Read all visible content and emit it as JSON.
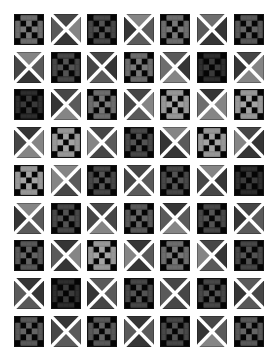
{
  "pattern": {
    "columns": 7,
    "rows": 9,
    "tile_size": [
      30,
      31
    ],
    "pitch": [
      36.6,
      37.7
    ],
    "shades": {
      "vdark": "#1c1c1c",
      "dark": "#353535",
      "mdark": "#464646",
      "mid": "#5a5a5a",
      "mlight": "#6e6e6e",
      "light": "#858585",
      "black": "#050505",
      "seam": "#ffffff"
    },
    "tiles": [
      [
        "C:mid",
        "X:mdark,light,dark,mid",
        "C:dark",
        "X:light,mid,mid,dark",
        "C:mid",
        "X:mlight,dark,dark,mid",
        "C:mdark"
      ],
      [
        "X:light,mid,dark,mdark",
        "C:dark",
        "X:mdark,dark,mid,mdark",
        "C:mid",
        "X:mid,dark,light,mlight",
        "C:vdark",
        "X:mdark,light,light,dark"
      ],
      [
        "C:vdark",
        "X:mdark,mid,light,dark",
        "C:mid",
        "X:mdark,light,mid,mdark",
        "C:light",
        "X:dark,light,light,mlight",
        "C:light"
      ],
      [
        "X:dark,light,light,mdark",
        "C:light",
        "X:mdark,mid,mdark,light",
        "C:dark",
        "X:light,mid,dark,dark",
        "C:light",
        "X:mdark,dark,dark,light"
      ],
      [
        "C:light",
        "X:light,mid,mdark,light",
        "C:dark",
        "X:mdark,mid,mid,mdark",
        "C:dark",
        "X:light,dark,mdark,mdark",
        "C:vdark"
      ],
      [
        "X:light,mid,mid,dark",
        "C:dark",
        "X:mdark,mdark,light,mdark",
        "C:mdark",
        "X:dark,mid,light,mid",
        "C:dark",
        "X:mdark,mid,mid,dark"
      ],
      [
        "C:mdark",
        "X:dark,light,dark,mid",
        "C:light",
        "X:dark,mid,dark,light",
        "C:mid",
        "X:mdark,dark,mid,light",
        "C:dark"
      ],
      [
        "X:dark,dark,mid,mid",
        "C:vdark",
        "X:mid,mid,mdark,dark",
        "C:dark",
        "X:mdark,mdark,mdark,mid",
        "C:dark",
        "X:mid,mdark,mid,dark"
      ],
      [
        "C:mdark",
        "X:dark,mid,mid,mdark",
        "C:mdark",
        "X:dark,mid,dark,mid",
        "C:dark",
        "X:mdark,mid,light,dark",
        "C:mdark"
      ]
    ]
  }
}
